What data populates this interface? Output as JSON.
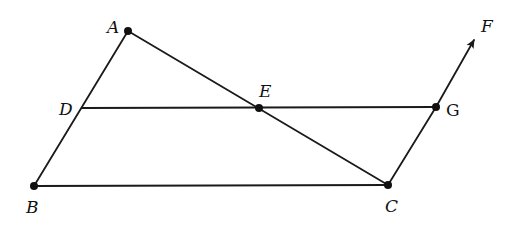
{
  "diagram": {
    "type": "geometry",
    "stroke_color": "#1a1a1a",
    "background": "#ffffff",
    "points": {
      "A": {
        "label": "A",
        "x": 128,
        "y": 31,
        "dot": true
      },
      "B": {
        "label": "B",
        "x": 34,
        "y": 186,
        "dot": true
      },
      "C": {
        "label": "C",
        "x": 388,
        "y": 185,
        "dot": true
      },
      "D": {
        "label": "D",
        "x": 82,
        "y": 108,
        "dot": false
      },
      "E": {
        "label": "E",
        "x": 259,
        "y": 108,
        "dot": true
      },
      "G": {
        "label": "G",
        "x": 436,
        "y": 107,
        "dot": true
      },
      "F": {
        "label": "F",
        "x": 474,
        "y": 39,
        "dot": false
      }
    },
    "segments": [
      "AB",
      "AC",
      "BC",
      "DG",
      "CG"
    ],
    "rays": [
      "GF"
    ]
  }
}
